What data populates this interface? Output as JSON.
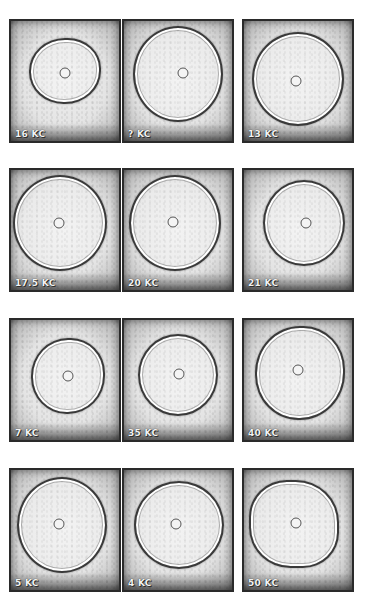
{
  "figure": {
    "rows": 4,
    "cols": 3,
    "panels": [
      {
        "label": "16 KC",
        "ring": {
          "cx": 50,
          "cy": 42,
          "w": 72,
          "h": 66,
          "shape": "oval"
        },
        "dot": {
          "x": 50,
          "y": 43
        }
      },
      {
        "label": "? KC",
        "ring": {
          "cx": 50,
          "cy": 44,
          "w": 90,
          "h": 96,
          "shape": "circle"
        },
        "dot": {
          "x": 55,
          "y": 43
        }
      },
      {
        "label": "13 KC",
        "ring": {
          "cx": 50,
          "cy": 48,
          "w": 92,
          "h": 94,
          "shape": "circle"
        },
        "dot": {
          "x": 48,
          "y": 50
        }
      },
      {
        "label": "17.5 KC",
        "ring": {
          "cx": 45,
          "cy": 44,
          "w": 94,
          "h": 96,
          "shape": "circle"
        },
        "dot": {
          "x": 44,
          "y": 44
        }
      },
      {
        "label": "20 KC",
        "ring": {
          "cx": 47,
          "cy": 44,
          "w": 92,
          "h": 96,
          "shape": "circle"
        },
        "dot": {
          "x": 45,
          "y": 43
        }
      },
      {
        "label": "21 KC",
        "ring": {
          "cx": 56,
          "cy": 44,
          "w": 82,
          "h": 86,
          "shape": "circle"
        },
        "dot": {
          "x": 57,
          "y": 44
        }
      },
      {
        "label": "7 KC",
        "ring": {
          "cx": 53,
          "cy": 47,
          "w": 74,
          "h": 76,
          "shape": "oval"
        },
        "dot": {
          "x": 53,
          "y": 47
        }
      },
      {
        "label": "35 KC",
        "ring": {
          "cx": 50,
          "cy": 46,
          "w": 80,
          "h": 82,
          "shape": "circle"
        },
        "dot": {
          "x": 51,
          "y": 45
        }
      },
      {
        "label": "40 KC",
        "ring": {
          "cx": 52,
          "cy": 44,
          "w": 90,
          "h": 94,
          "shape": "oval"
        },
        "dot": {
          "x": 50,
          "y": 42
        }
      },
      {
        "label": "5 KC",
        "ring": {
          "cx": 47,
          "cy": 46,
          "w": 90,
          "h": 96,
          "shape": "circle"
        },
        "dot": {
          "x": 44,
          "y": 45
        }
      },
      {
        "label": "4 KC",
        "ring": {
          "cx": 51,
          "cy": 46,
          "w": 90,
          "h": 88,
          "shape": "circle"
        },
        "dot": {
          "x": 48,
          "y": 45
        }
      },
      {
        "label": "50 KC",
        "ring": {
          "cx": 46,
          "cy": 45,
          "w": 90,
          "h": 88,
          "shape": "hex"
        },
        "dot": {
          "x": 48,
          "y": 44
        }
      }
    ],
    "layout": {
      "col_x": [
        9,
        122,
        242
      ],
      "row_y": [
        19,
        168,
        318,
        468
      ],
      "panel_w": 112,
      "panel_h": 124
    }
  }
}
